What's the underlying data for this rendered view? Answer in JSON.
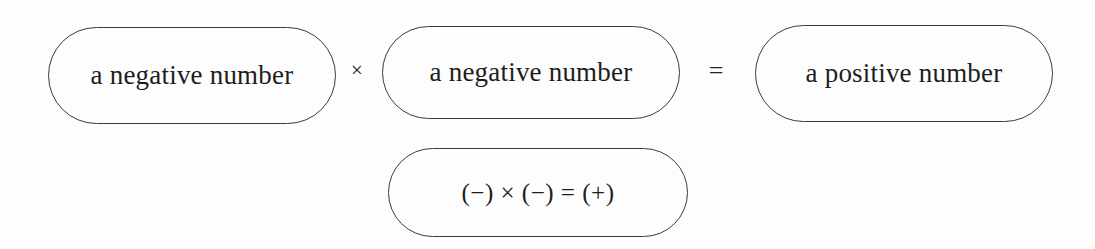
{
  "diagram": {
    "type": "sign-rule-diagram",
    "title_text": "",
    "background_color": "#fdfdfd",
    "stroke_color": "#3b3b3b",
    "text_color": "#1d1d1d",
    "rows": [
      {
        "name": "word-statement",
        "nodes": [
          {
            "id": "pill-neg-1",
            "label": "a negative number"
          },
          {
            "id": "pill-neg-2",
            "label": "a negative number"
          },
          {
            "id": "pill-pos",
            "label": "a positive number"
          }
        ],
        "operators": [
          {
            "id": "op-times",
            "symbol": "×",
            "name": "multiplication-sign"
          },
          {
            "id": "op-equals",
            "symbol": "=",
            "name": "equals-sign"
          }
        ]
      },
      {
        "name": "symbolic-statement",
        "nodes": [
          {
            "id": "pill-formula",
            "label": "(−) × (−) = (+)"
          }
        ],
        "operators": []
      }
    ]
  }
}
